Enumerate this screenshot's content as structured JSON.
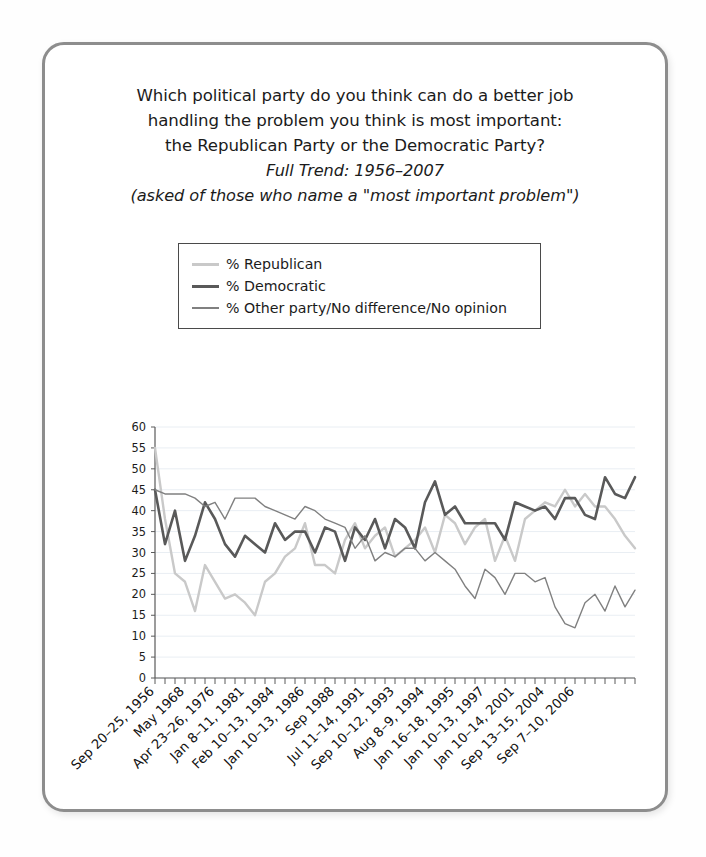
{
  "card": {
    "border_color": "#8d8d8d",
    "background": "#ffffff"
  },
  "title": {
    "line1": "Which political party do you think can do a better job",
    "line2": "handling the problem you think is most important:",
    "line3": "the Republican Party or the Democratic Party?",
    "line4": "Full Trend: 1956–2007",
    "line5": "(asked of those who name a \"most important problem\")"
  },
  "legend": {
    "items": [
      {
        "label": "% Republican",
        "color": "#c9c9c9"
      },
      {
        "label": "% Democratic",
        "color": "#595959"
      },
      {
        "label": "% Other party/No difference/No opinion",
        "color": "#808080"
      }
    ]
  },
  "chart_data": {
    "type": "line",
    "title": "Which political party do you think can do a better job handling the problem you think is most important: the Republican Party or the Democratic Party?",
    "subtitle": "Full Trend: 1956–2007",
    "xlabel": "",
    "ylabel": "",
    "ylim": [
      0,
      60
    ],
    "ytick_step": 5,
    "yticks": [
      0,
      5,
      10,
      15,
      20,
      25,
      30,
      35,
      40,
      45,
      50,
      55,
      60
    ],
    "grid": true,
    "legend_position": "above-plot",
    "n_points": 49,
    "xtick_labels": [
      "Sep 20–25, 1956",
      "May 1968",
      "Apr 23–26, 1976",
      "Jan 8–11, 1981",
      "Feb 10–13, 1984",
      "Jan 10–13, 1986",
      "Sep 1988",
      "Jul 11–14, 1991",
      "Sep 10–12, 1993",
      "Aug 8–9, 1994",
      "Jan 16–18, 1995",
      "Jan 10–13, 1997",
      "Jan 10–14, 2001",
      "Sep 13–15, 2004",
      "Sep 7–10, 2006"
    ],
    "xtick_indices": [
      0,
      3,
      6,
      9,
      12,
      15,
      18,
      21,
      24,
      27,
      30,
      33,
      36,
      39,
      42
    ],
    "series": [
      {
        "name": "% Republican",
        "color": "#c9c9c9",
        "width": 2.4,
        "values": [
          55,
          38,
          25,
          23,
          16,
          27,
          23,
          19,
          20,
          18,
          15,
          23,
          25,
          29,
          31,
          37,
          27,
          27,
          25,
          33,
          37,
          31,
          34,
          36,
          29,
          31,
          33,
          36,
          30,
          39,
          37,
          32,
          36,
          38,
          28,
          34,
          28,
          38,
          40,
          42,
          41,
          45,
          41,
          44,
          41,
          41,
          38,
          34,
          31
        ]
      },
      {
        "name": "% Democratic",
        "color": "#595959",
        "width": 2.6,
        "values": [
          45,
          32,
          40,
          28,
          34,
          42,
          38,
          32,
          29,
          34,
          32,
          30,
          37,
          33,
          35,
          35,
          30,
          36,
          35,
          28,
          36,
          33,
          38,
          31,
          38,
          36,
          31,
          42,
          47,
          39,
          41,
          37,
          37,
          37,
          37,
          33,
          42,
          41,
          40,
          41,
          38,
          43,
          43,
          39,
          38,
          48,
          44,
          43,
          48
        ]
      },
      {
        "name": "% Other party/No difference/No opinion",
        "color": "#808080",
        "width": 1.4,
        "values": [
          45,
          44,
          44,
          44,
          43,
          41,
          42,
          38,
          43,
          43,
          43,
          41,
          40,
          39,
          38,
          41,
          40,
          38,
          37,
          36,
          31,
          34,
          28,
          30,
          29,
          31,
          31,
          28,
          30,
          28,
          26,
          22,
          19,
          26,
          24,
          20,
          25,
          25,
          23,
          24,
          17,
          13,
          12,
          18,
          20,
          16,
          22,
          17,
          21
        ]
      }
    ]
  }
}
